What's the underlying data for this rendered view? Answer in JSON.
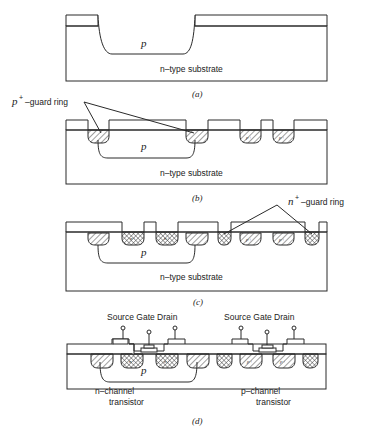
{
  "figure": {
    "panels": [
      {
        "id": "a",
        "caption": "(a)",
        "well_label": "p",
        "substrate_label": "n–type substrate"
      },
      {
        "id": "b",
        "caption": "(b)",
        "well_label": "p",
        "substrate_label": "n–type substrate",
        "callout": {
          "base": "p",
          "sup": "+",
          "text": "–guard ring"
        },
        "region_label": "p+"
      },
      {
        "id": "c",
        "caption": "(c)",
        "well_label": "p",
        "substrate_label": "n–type substrate",
        "callout": {
          "base": "n",
          "sup": "+",
          "text": "–guard ring"
        },
        "region_label_n": "n+",
        "region_label_p": "p+"
      },
      {
        "id": "d",
        "caption": "(d)",
        "well_label": "p",
        "terminals_left": "Source Gate Drain",
        "terminals_right": "Source Gate Drain",
        "nchannel_line1": "n–channel",
        "nchannel_line2": "transistor",
        "pchannel_line1": "p–channel",
        "pchannel_line2": "transistor",
        "region_label_n": "n+",
        "region_label_p": "p+"
      }
    ]
  }
}
